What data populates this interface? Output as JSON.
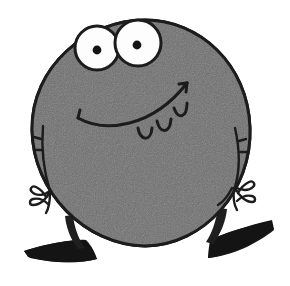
{
  "artwork": {
    "title": "Cartoon round gray monster",
    "subject_name": "round-gray-monster",
    "alt_text": "A hand-drawn cartoon creature with a large round gray body, two big bulging white eyes with small black pupils, a wide smiling mouth with three teeth, two thin dangling arms with splayed fingers, and two thin legs ending in flat black wedge-shaped feet.",
    "background_color": "#ffffff",
    "body_fill": "#6f6f6f",
    "body_fill_light": "#7b7b7b",
    "outline_color": "#1c1c1c",
    "eye_white": "#fdfdfd",
    "pupil_color": "#141414",
    "foot_color": "#1a1a1a",
    "leg_color": "#1f1f1f",
    "line_weight": "3",
    "parts": [
      {
        "name": "body",
        "label": "Round body",
        "shape": "circle-blob"
      },
      {
        "name": "left-eye",
        "label": "Left eye",
        "shape": "circle"
      },
      {
        "name": "right-eye",
        "label": "Right eye",
        "shape": "circle"
      },
      {
        "name": "left-pupil",
        "label": "Left pupil",
        "shape": "dot"
      },
      {
        "name": "right-pupil",
        "label": "Right pupil",
        "shape": "dot"
      },
      {
        "name": "mouth",
        "label": "Smiling mouth",
        "shape": "curve"
      },
      {
        "name": "tooth-1",
        "label": "Tooth one",
        "shape": "rounded-tab"
      },
      {
        "name": "tooth-2",
        "label": "Tooth two",
        "shape": "rounded-tab"
      },
      {
        "name": "tooth-3",
        "label": "Tooth three",
        "shape": "rounded-tab"
      },
      {
        "name": "left-arm",
        "label": "Left arm",
        "shape": "line"
      },
      {
        "name": "right-arm",
        "label": "Right arm",
        "shape": "line"
      },
      {
        "name": "left-hand",
        "label": "Left hand",
        "shape": "fingers"
      },
      {
        "name": "right-hand",
        "label": "Right hand",
        "shape": "fingers"
      },
      {
        "name": "left-leg",
        "label": "Left leg",
        "shape": "stub"
      },
      {
        "name": "right-leg",
        "label": "Right leg",
        "shape": "stub"
      },
      {
        "name": "left-foot",
        "label": "Left foot",
        "shape": "wedge"
      },
      {
        "name": "right-foot",
        "label": "Right foot",
        "shape": "wedge"
      }
    ]
  }
}
